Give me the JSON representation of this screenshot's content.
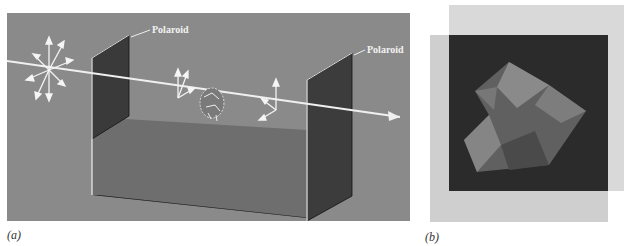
{
  "figure": {
    "panel_a": {
      "caption": "(a)",
      "labels": {
        "polaroid_1": "Polaroid",
        "polaroid_2": "Polaroid"
      },
      "elements": [
        "unpolarized-light-arrows",
        "polarizer-sheet",
        "polarized-light-arrows",
        "sample-molecule",
        "rotated-polarization-arrows",
        "analyzer-sheet",
        "light-beam",
        "sample-trough"
      ],
      "colors": {
        "background": "#8a8a8a",
        "sheet": "#3a3a3a",
        "beam": "#f0f0f0"
      }
    },
    "panel_b": {
      "caption": "(b)",
      "elements": [
        "back-polaroid-sheet",
        "front-polaroid-sheet",
        "crossed-overlap-dark-region",
        "birefringent-crystal"
      ],
      "colors": {
        "sheet": "#d4d4d4",
        "overlap": "#2b2b2b"
      }
    }
  }
}
